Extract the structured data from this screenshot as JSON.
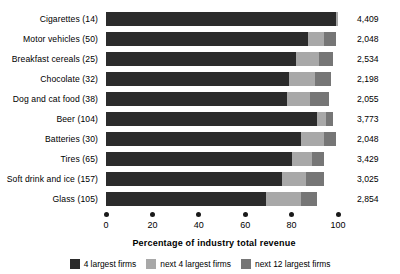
{
  "chart_data": {
    "type": "bar",
    "orientation": "horizontal",
    "stacked": true,
    "title": "",
    "xlabel": "Percentage of industry total revenue",
    "ylabel": "",
    "xlim": [
      0,
      110
    ],
    "xticks": [
      0,
      20,
      40,
      60,
      80,
      100
    ],
    "xtick_labels": [
      "0",
      "20",
      "40",
      "60",
      "80",
      "100"
    ],
    "grid": false,
    "legend_position": "bottom",
    "categories": [
      "Cigarettes (14)",
      "Motor vehicles (50)",
      "Breakfast cereals (25)",
      "Chocolate (32)",
      "Dog and cat food (38)",
      "Beer (104)",
      "Batteries (30)",
      "Tires (65)",
      "Soft drink and ice (157)",
      "Glass (105)"
    ],
    "series": [
      {
        "name": "4 largest firms",
        "color": "#2b2b2b",
        "values": [
          99,
          87,
          82,
          79,
          78,
          91,
          84,
          80,
          76,
          69
        ]
      },
      {
        "name": "next 4 largest firms",
        "color": "#a8a8a8",
        "values": [
          1,
          7,
          10,
          11,
          10,
          4,
          10,
          9,
          10,
          15
        ]
      },
      {
        "name": "next 12 largest firms",
        "color": "#767676",
        "values": [
          0,
          5,
          6,
          7,
          8,
          3,
          5,
          5,
          8,
          7
        ]
      }
    ],
    "right_column_label": "",
    "right_values": [
      "4,409",
      "2,048",
      "2,534",
      "2,198",
      "2,055",
      "3,773",
      "2,048",
      "3,429",
      "3,025",
      "2,854"
    ]
  },
  "legend": {
    "items": [
      {
        "label": "4 largest firms",
        "color": "#2b2b2b"
      },
      {
        "label": "next 4 largest firms",
        "color": "#a8a8a8"
      },
      {
        "label": "next 12 largest firms",
        "color": "#767676"
      }
    ]
  }
}
